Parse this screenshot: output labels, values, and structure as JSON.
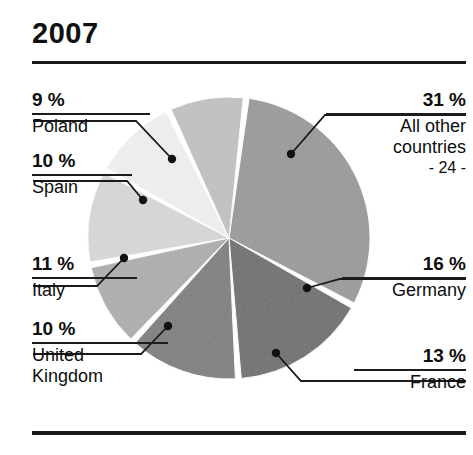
{
  "title": "2007",
  "chart_data": {
    "type": "pie",
    "title": "2007",
    "unit": "%",
    "categories": [
      "All other countries",
      "Germany",
      "France",
      "United Kingdom",
      "Italy",
      "Spain",
      "Poland"
    ],
    "values": [
      31,
      16,
      13,
      10,
      11,
      10,
      9
    ],
    "labels": [
      {
        "key": "allother",
        "pct": "31 %",
        "value": 31,
        "name": "All other\ncountries",
        "sub": "- 24 -",
        "side": "right",
        "fill": "#9a9a9a",
        "dot": {
          "x": 291,
          "y": 154
        },
        "elbow": {
          "x": 325,
          "y": 115
        },
        "end": {
          "x": 466,
          "y": 115
        }
      },
      {
        "key": "germany",
        "pct": "16 %",
        "value": 16,
        "name": "Germany",
        "sub": "",
        "side": "right",
        "fill": "#6f6f6f",
        "dot": {
          "x": 307,
          "y": 288
        },
        "elbow": {
          "x": 340,
          "y": 279
        },
        "end": {
          "x": 466,
          "y": 279
        }
      },
      {
        "key": "france",
        "pct": "13 %",
        "value": 13,
        "name": "France",
        "sub": "",
        "side": "right",
        "fill": "#7f7f7f",
        "dot": {
          "x": 276,
          "y": 353
        },
        "elbow": {
          "x": 301,
          "y": 381
        },
        "end": {
          "x": 466,
          "y": 381
        }
      },
      {
        "key": "uk",
        "pct": "10 %",
        "value": 10,
        "name": "United\nKingdom",
        "sub": "",
        "side": "left",
        "fill": "#aeaeae",
        "dot": {
          "x": 168,
          "y": 326
        },
        "elbow": {
          "x": 141,
          "y": 354
        },
        "end": {
          "x": 33,
          "y": 354
        }
      },
      {
        "key": "italy",
        "pct": "11 %",
        "value": 11,
        "name": "Italy",
        "sub": "",
        "side": "left",
        "fill": "#d8d8d8",
        "dot": {
          "x": 124,
          "y": 258
        },
        "elbow": {
          "x": 97,
          "y": 286
        },
        "end": {
          "x": 33,
          "y": 286
        }
      },
      {
        "key": "spain",
        "pct": "10 %",
        "value": 10,
        "name": "Spain",
        "sub": "",
        "side": "left",
        "fill": "#f1f1f1",
        "dot": {
          "x": 143,
          "y": 200
        },
        "elbow": {
          "x": 127,
          "y": 181
        },
        "end": {
          "x": 33,
          "y": 181
        }
      },
      {
        "key": "poland",
        "pct": "9 %",
        "value": 9,
        "name": "Poland",
        "sub": "",
        "side": "left",
        "fill": "#c2c2c2",
        "dot": {
          "x": 172,
          "y": 159
        },
        "elbow": {
          "x": 136,
          "y": 121
        },
        "end": {
          "x": 33,
          "y": 121
        }
      }
    ],
    "geometry": {
      "cx": 229,
      "cy": 238,
      "r": 141,
      "gap_deg": 2.4,
      "start_deg": -83
    },
    "legend_position": "callout-labels",
    "grid": false
  },
  "colors": {
    "ink": "#101010",
    "rule": "#1a1a1a",
    "background": "#ffffff"
  }
}
